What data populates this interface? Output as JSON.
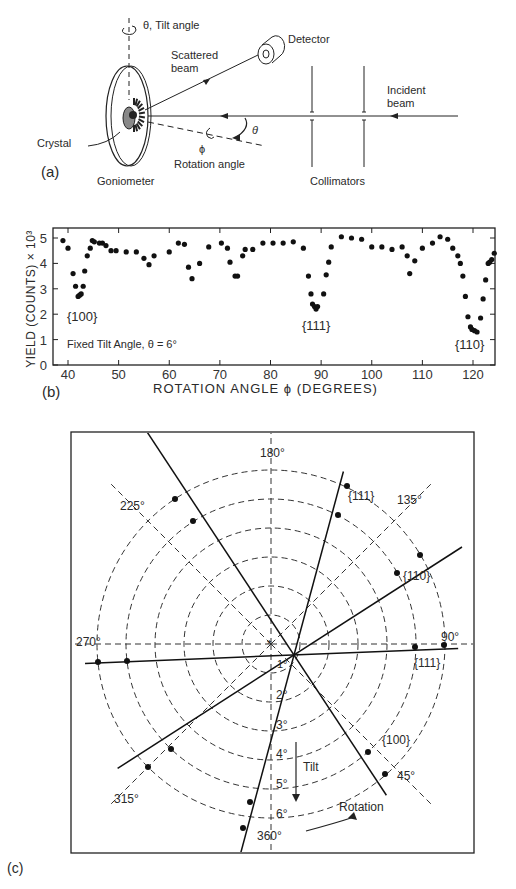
{
  "panel_a": {
    "label": "(a)",
    "tilt_label": "θ, Tilt angle",
    "detector_label": "Detector",
    "scattered_label_1": "Scattered",
    "scattered_label_2": "beam",
    "incident_label_1": "Incident",
    "incident_label_2": "beam",
    "crystal_label": "Crystal",
    "goniometer_label": "Goniometer",
    "rotation_label": "Rotation angle",
    "phi_symbol": "ϕ",
    "theta_symbol": "θ",
    "collimators_label": "Collimators"
  },
  "panel_b": {
    "label": "(b)",
    "annotation": "Fixed Tilt Angle, θ = 6°",
    "dip_labels": [
      "{100}",
      "{111}",
      "{110}"
    ]
  },
  "panel_c": {
    "label": "(c)",
    "rotation_labels": [
      "180°",
      "225°",
      "135°",
      "270°",
      "90°",
      "315°",
      "45°",
      "360°"
    ],
    "tilt_labels": [
      "1°",
      "2°",
      "3°",
      "4°",
      "5°",
      "6°"
    ],
    "plane_labels": [
      "{111}",
      "{110}",
      "{111}",
      "{100}"
    ],
    "tilt_arrow_label": "Tilt",
    "rotation_arrow_label": "Rotation"
  },
  "chart_data": [
    {
      "type": "scatter",
      "title": "",
      "xlabel": "ROTATION ANGLE ϕ (DEGREES)",
      "ylabel": "YIELD (COUNTS) × 10³",
      "xlim": [
        37,
        125
      ],
      "ylim": [
        0,
        5.4
      ],
      "xticks": [
        40,
        50,
        60,
        70,
        80,
        90,
        100,
        110,
        120
      ],
      "yticks": [
        0,
        1,
        2,
        3,
        4,
        5
      ],
      "grid": false,
      "annotations": [
        "{100}",
        "{111}",
        "{110}",
        "Fixed Tilt Angle, θ = 6°"
      ],
      "series": [
        {
          "name": "yield",
          "x": [
            39,
            40,
            41,
            41.5,
            42,
            42.3,
            42.6,
            43,
            43.3,
            43.8,
            44.4,
            44.8,
            45.2,
            46.2,
            46.8,
            47.5,
            48.5,
            49.5,
            51.5,
            53.5,
            55,
            56,
            57,
            60,
            61.8,
            63,
            63.8,
            64.5,
            66,
            67.8,
            70.3,
            71.5,
            72,
            73,
            73.5,
            74.5,
            75,
            76.5,
            78.5,
            80.5,
            82.5,
            84.5,
            86.5,
            87.5,
            88,
            88.3,
            88.7,
            89,
            89.3,
            90.5,
            91,
            91.5,
            92,
            94,
            96,
            98,
            100,
            102,
            104,
            106,
            107,
            107.5,
            108.5,
            110,
            112,
            113.5,
            115,
            116,
            117,
            117.5,
            118,
            118.5,
            119,
            119.5,
            119.8,
            120.3,
            120.8,
            121.5,
            122,
            122.5,
            123,
            123.3,
            123.7,
            124.2
          ],
          "values": [
            4.9,
            4.6,
            3.6,
            3.1,
            2.7,
            2.75,
            2.8,
            3.1,
            3.7,
            4.3,
            4.6,
            4.9,
            4.85,
            4.8,
            4.8,
            4.7,
            4.5,
            4.5,
            4.45,
            4.45,
            4.2,
            3.95,
            4.3,
            4.45,
            4.8,
            4.75,
            3.85,
            3.4,
            4.0,
            4.65,
            4.8,
            4.6,
            4.05,
            3.5,
            3.5,
            4.3,
            4.55,
            4.55,
            4.8,
            4.8,
            4.8,
            4.85,
            4.6,
            3.5,
            2.8,
            2.4,
            2.3,
            2.2,
            2.3,
            2.8,
            3.55,
            4.05,
            4.65,
            5.05,
            5.0,
            4.95,
            4.65,
            4.65,
            4.55,
            4.65,
            4.3,
            3.6,
            4.1,
            4.6,
            4.8,
            5.05,
            4.95,
            4.6,
            4.3,
            4.0,
            3.5,
            2.7,
            1.9,
            1.5,
            1.4,
            1.35,
            1.3,
            1.85,
            2.6,
            3.35,
            4.0,
            4.05,
            4.15,
            4.4
          ]
        }
      ]
    },
    {
      "type": "polar-diagram",
      "title": "",
      "radial_axis": "Tilt (degrees)",
      "radial_ticks": [
        1,
        2,
        3,
        4,
        5,
        6
      ],
      "angular_axis": "Rotation (degrees)",
      "angular_ticks": [
        45,
        90,
        135,
        180,
        225,
        270,
        315,
        360
      ],
      "lines": [
        {
          "name": "{111}",
          "direction": "near-vertical steep"
        },
        {
          "name": "{110}",
          "direction": "diagonal up-right / down-left"
        },
        {
          "name": "{111}",
          "direction": "near-horizontal"
        },
        {
          "name": "{100}",
          "direction": "diagonal up-left / down-right"
        }
      ]
    }
  ]
}
